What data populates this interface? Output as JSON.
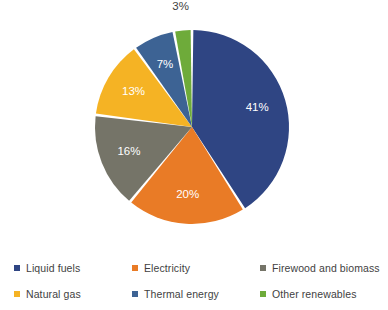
{
  "chart_data": {
    "type": "pie",
    "title": "",
    "subtitle": "",
    "xlabel": "",
    "ylabel": "",
    "grid": false,
    "legend_position": "bottom",
    "legend_columns": 3,
    "legend_rows": 2,
    "start_angle_deg": 0,
    "direction": "clockwise",
    "categories": [
      "Liquid fuels",
      "Electricity",
      "Firewood and biomass",
      "Natural gas",
      "Thermal energy",
      "Other renewables"
    ],
    "values": [
      41,
      20,
      16,
      13,
      7,
      3
    ],
    "value_unit": "%",
    "data_labels": [
      "41%",
      "20%",
      "16%",
      "13%",
      "7%",
      "3%"
    ],
    "colors": [
      "#2F4583",
      "#E97B26",
      "#757468",
      "#F5B324",
      "#3D6394",
      "#6EAB3A"
    ],
    "slices": [
      {
        "label": "Liquid fuels",
        "value": 41,
        "data_label": "41%",
        "color": "#2F4583",
        "label_color": "#ffffff",
        "label_placement": "inside"
      },
      {
        "label": "Electricity",
        "value": 20,
        "data_label": "20%",
        "color": "#E97B26",
        "label_color": "#ffffff",
        "label_placement": "inside"
      },
      {
        "label": "Firewood and biomass",
        "value": 16,
        "data_label": "16%",
        "color": "#757468",
        "label_color": "#ffffff",
        "label_placement": "inside"
      },
      {
        "label": "Natural gas",
        "value": 13,
        "data_label": "13%",
        "color": "#F5B324",
        "label_color": "#ffffff",
        "label_placement": "inside"
      },
      {
        "label": "Thermal energy",
        "value": 7,
        "data_label": "7%",
        "color": "#3D6394",
        "label_color": "#ffffff",
        "label_placement": "inside"
      },
      {
        "label": "Other renewables",
        "value": 3,
        "data_label": "3%",
        "color": "#6EAB3A",
        "label_color": "#3f3f3f",
        "label_placement": "outside"
      }
    ]
  },
  "legend": {
    "items": [
      {
        "label": "Liquid fuels",
        "color": "#2F4583"
      },
      {
        "label": "Electricity",
        "color": "#E97B26"
      },
      {
        "label": "Firewood and biomass",
        "color": "#757468"
      },
      {
        "label": "Natural gas",
        "color": "#F5B324"
      },
      {
        "label": "Thermal energy",
        "color": "#3D6394"
      },
      {
        "label": "Other renewables",
        "color": "#6EAB3A"
      }
    ]
  },
  "colors": {
    "background": "#FFFFFF",
    "slice_separator": "#FFFFFF",
    "text": "#3F3F3F",
    "inside_label": "#FFFFFF"
  }
}
